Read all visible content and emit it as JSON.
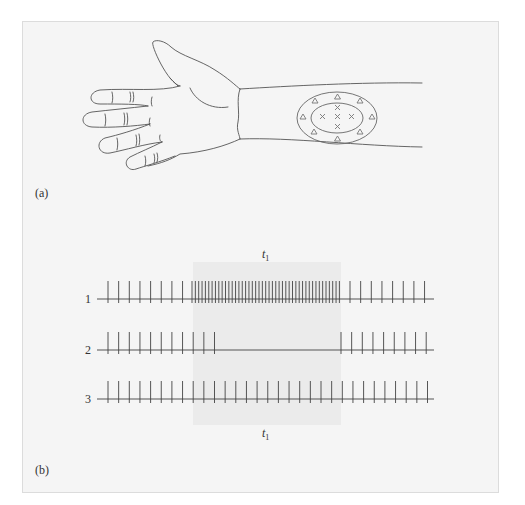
{
  "figure": {
    "panel_a": {
      "label": "(a)",
      "description": "Outline drawing of a hand and forearm with an elliptical receptive field on the forearm",
      "receptive_field": {
        "center_symbol": "×",
        "center_count": 6,
        "surround_symbol": "△",
        "surround_count": 8
      }
    },
    "panel_b": {
      "label": "(b)",
      "time_marker_top": "t",
      "time_marker_top_sub": "1",
      "time_marker_bottom": "t",
      "time_marker_bottom_sub": "1",
      "rows": [
        {
          "label": "1",
          "pattern": "baseline firing, strongly increased firing during t1, then baseline"
        },
        {
          "label": "2",
          "pattern": "baseline firing, silenced during t1, then baseline"
        },
        {
          "label": "3",
          "pattern": "steady baseline firing throughout"
        }
      ]
    },
    "caption_partial": "(faint, cut-off caption text)"
  },
  "colors": {
    "frame_bg": "#f5f5f5",
    "frame_border": "#dcdcdc",
    "shade": "#ebebeb",
    "line": "#555555",
    "spike": "#444444",
    "field_line": "#666666"
  }
}
